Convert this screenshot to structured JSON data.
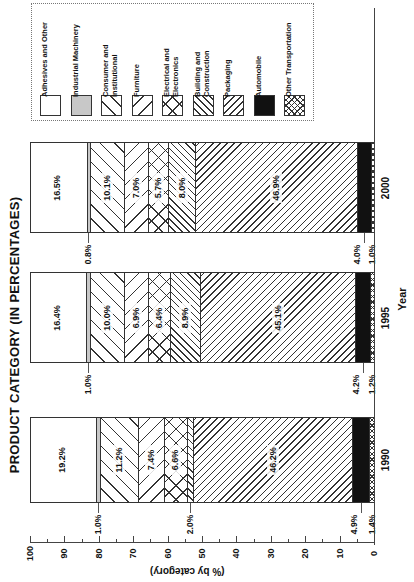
{
  "chart_data": {
    "type": "bar",
    "stacked": true,
    "orientation_note": "figure rotated 90 degrees counter-clockwise; 100% stacked bars",
    "title": "PRODUCT CATEGORY  (IN PERCENTAGES)",
    "xlabel": "Year",
    "ylabel": "(% by category)",
    "ylim": [
      0,
      100
    ],
    "yticks": [
      0,
      10,
      20,
      30,
      40,
      50,
      60,
      70,
      80,
      90,
      100
    ],
    "categories": [
      "1990",
      "1995",
      "2000"
    ],
    "legend_position": "top-right (appears top-left in rotated image)",
    "series": [
      {
        "name": "Adhesives and Other",
        "pattern": "blank",
        "values": [
          19.2,
          16.4,
          16.5
        ]
      },
      {
        "name": "Industrial Machinery",
        "pattern": "light-gray",
        "values": [
          1.0,
          1.0,
          0.8
        ]
      },
      {
        "name": "Consumer and Institutional",
        "pattern": "wide-forward-diagonal",
        "values": [
          11.2,
          10.0,
          10.1
        ]
      },
      {
        "name": "Furniture",
        "pattern": "wide-back-diagonal",
        "values": [
          7.4,
          6.9,
          7.0
        ]
      },
      {
        "name": "Electrical and Electronics",
        "pattern": "wide-crosshatch",
        "values": [
          6.6,
          6.4,
          5.7
        ]
      },
      {
        "name": "Building and Construction",
        "pattern": "narrow-forward-diagonal",
        "values": [
          2.0,
          8.9,
          8.0
        ]
      },
      {
        "name": "Packaging",
        "pattern": "narrow-back-diagonal",
        "values": [
          46.2,
          45.1,
          46.9
        ]
      },
      {
        "name": "Automobile",
        "pattern": "solid-black",
        "values": [
          4.9,
          4.2,
          4.0
        ]
      },
      {
        "name": "Other Transportation",
        "pattern": "fine-crosshatch",
        "values": [
          1.4,
          1.2,
          1.0
        ]
      }
    ]
  },
  "title": "PRODUCT CATEGORY  (IN PERCENTAGES)",
  "axis": {
    "label": "(% by category)",
    "ticks": [
      "100",
      "90",
      "80",
      "70",
      "60",
      "50",
      "40",
      "30",
      "20",
      "10",
      "0"
    ]
  },
  "xaxis_label": "Year",
  "legend": [
    {
      "label": "Adhesives and Other",
      "pattern": "blank"
    },
    {
      "label": "Industrial Machinery",
      "pattern": "gray"
    },
    {
      "label": "Consumer and\nInstitutional",
      "pattern": "fwd-wide"
    },
    {
      "label": "Furniture",
      "pattern": "back-wide"
    },
    {
      "label": "Electrical and\nElectronics",
      "pattern": "cross-wide"
    },
    {
      "label": "Building and\nConstruction",
      "pattern": "fwd-narrow"
    },
    {
      "label": "Packaging",
      "pattern": "back-narrow"
    },
    {
      "label": "Automobile",
      "pattern": "black"
    },
    {
      "label": "Other Transportation",
      "pattern": "cross-fine"
    }
  ],
  "bars": [
    {
      "year": "2000",
      "labels": [
        "16.5%",
        "0.8%",
        "10.1%",
        "7.0%",
        "5.7%",
        "8.0%",
        "46.9%",
        "4.0%",
        "1.0%"
      ]
    },
    {
      "year": "1995",
      "labels": [
        "16.4%",
        "1.0%",
        "10.0%",
        "6.9%",
        "6.4%",
        "8.9%",
        "45.1%",
        "4.2%",
        "1.2%"
      ]
    },
    {
      "year": "1990",
      "labels": [
        "19.2%",
        "1.0%",
        "11.2%",
        "7.4%",
        "6.6%",
        "2.0%",
        "46.2%",
        "4.9%",
        "1.4%"
      ]
    }
  ],
  "colors": {
    "ink": "#222222",
    "gray_fill": "#c8c8c8",
    "black_fill": "#111111"
  }
}
